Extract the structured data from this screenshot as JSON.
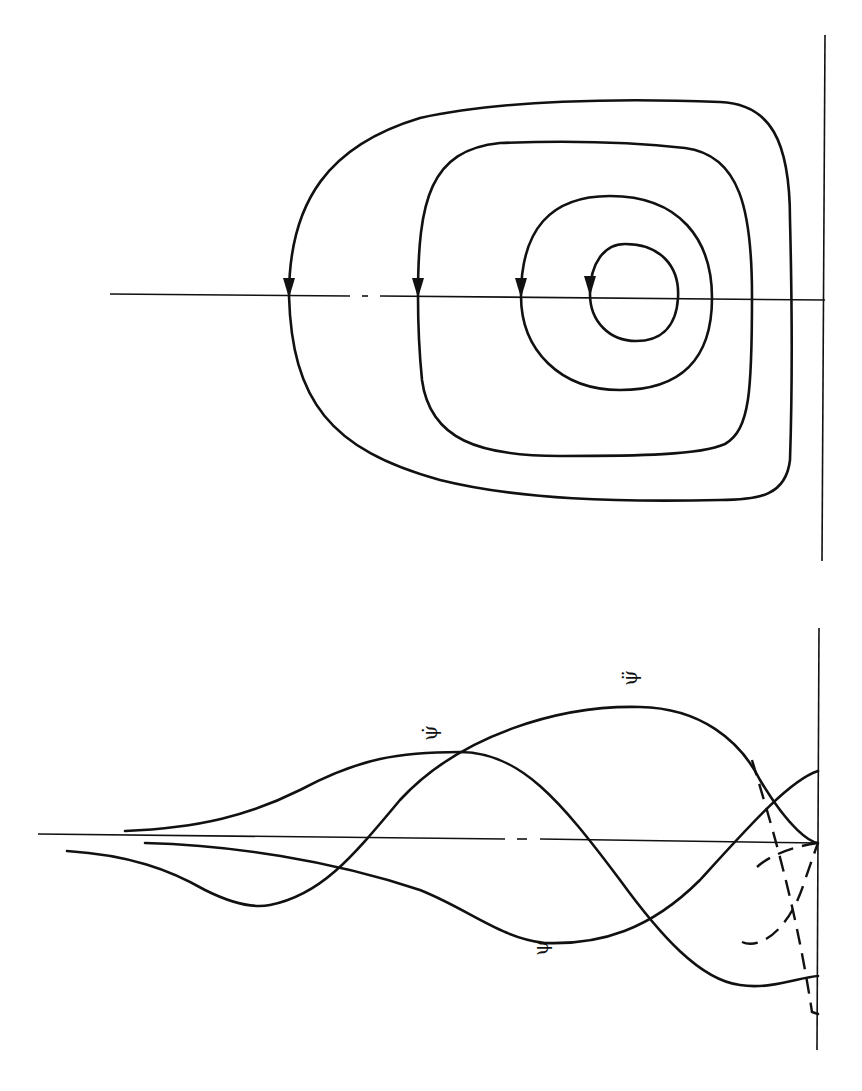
{
  "figure": {
    "panels": [
      {
        "id": "phase-portrait",
        "description": "Closed orbits (nested loops) around a center, with direction arrows where each loop crosses the horizontal axis",
        "orbit_count": 4,
        "arrow_direction": "down"
      },
      {
        "id": "waveforms",
        "description": "Curves labelled psi, psi-dot and psi-double-dot, with dashed continuations near the right boundary",
        "labels": {
          "psi": "ψ",
          "psi_dot": "ψ̇",
          "psi_ddot": "ψ̈"
        }
      }
    ]
  }
}
